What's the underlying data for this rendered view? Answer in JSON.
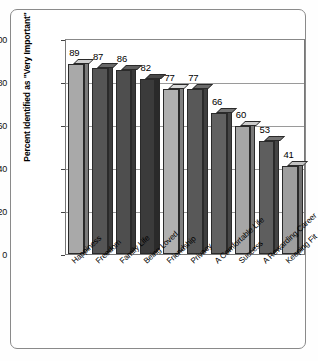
{
  "chart_data": {
    "type": "bar",
    "title": "",
    "subtitle": "",
    "xlabel": "",
    "ylabel": "Percent Identified as \"Very Important\"",
    "ylim": [
      0,
      100
    ],
    "yticks": [
      0,
      20,
      40,
      60,
      80,
      100
    ],
    "ytick_labels": [
      "0",
      "20",
      "40",
      "60",
      "80",
      "100"
    ],
    "grid": "horizontal",
    "legend": "none",
    "categories": [
      "Happiness",
      "Freedom",
      "Family Life",
      "Being Loved",
      "Friendship",
      "Privacy",
      "A Comfortable Life",
      "Success",
      "A Rewarding Career",
      "Keeping Fit"
    ],
    "values": [
      89,
      87,
      86,
      82,
      77,
      77,
      66,
      60,
      53,
      41
    ],
    "value_labels": [
      "89",
      "87",
      "86",
      "82",
      "77",
      "77",
      "66",
      "60",
      "53",
      "41"
    ],
    "bar_colors": [
      "#a9a9a9",
      "#555555",
      "#4e4e4e",
      "#3b3b3b",
      "#b0b0b0",
      "#585858",
      "#616161",
      "#a6a6a6",
      "#5e5e5e",
      "#9e9e9e"
    ],
    "style": "3d-perspective-bars"
  },
  "colors": {
    "frame_border": "#8a8a8a",
    "plot_border": "#777777",
    "gridline": "#9a9a9a",
    "text": "#000000",
    "background": "#ffffff"
  }
}
